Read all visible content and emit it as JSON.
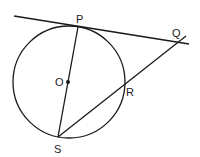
{
  "diagram": {
    "type": "geometry",
    "colors": {
      "stroke": "#1a1a1a",
      "background": "#ffffff"
    },
    "circle": {
      "cx": 69,
      "cy": 82,
      "r": 56,
      "center_label": "O"
    },
    "points": {
      "P": {
        "label": "P",
        "x": 78,
        "y": 27
      },
      "O": {
        "label": "O",
        "x": 68,
        "y": 82
      },
      "R": {
        "label": "R",
        "x": 123,
        "y": 86
      },
      "S": {
        "label": "S",
        "x": 58,
        "y": 137
      },
      "Q": {
        "label": "Q",
        "x": 180,
        "y": 41
      }
    },
    "segments": [
      {
        "name": "tangent-PQ",
        "from": [
          14,
          16
        ],
        "to": [
          189,
          44
        ]
      },
      {
        "name": "diameter-PS",
        "from": [
          78,
          27
        ],
        "to": [
          58,
          137
        ]
      },
      {
        "name": "secant-SQ",
        "from": [
          58,
          137
        ],
        "to": [
          186,
          36
        ]
      }
    ]
  }
}
